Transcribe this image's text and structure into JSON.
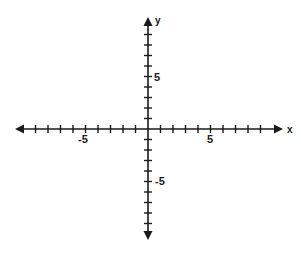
{
  "chart_data": {
    "type": "coordinate-plane",
    "title": "",
    "xlabel": "x",
    "ylabel": "y",
    "xlim": [
      -10,
      10
    ],
    "ylim": [
      -10,
      10
    ],
    "x_ticks": [
      -9,
      -8,
      -7,
      -6,
      -5,
      -4,
      -3,
      -2,
      -1,
      1,
      2,
      3,
      4,
      5,
      6,
      7,
      8,
      9
    ],
    "y_ticks": [
      -9,
      -8,
      -7,
      -6,
      -5,
      -4,
      -3,
      -2,
      -1,
      1,
      2,
      3,
      4,
      5,
      6,
      7,
      8,
      9
    ],
    "x_tick_labels": [
      {
        "value": -5,
        "text": "-5"
      },
      {
        "value": 5,
        "text": "5"
      }
    ],
    "y_tick_labels": [
      {
        "value": 5,
        "text": "5"
      },
      {
        "value": -5,
        "text": "-5"
      }
    ],
    "grid": false,
    "arrows": true,
    "series": []
  },
  "layout": {
    "origin": [
      148,
      129
    ],
    "x_unit_px": 12.5,
    "y_unit_px": 10.5,
    "x_axis_ends": [
      15,
      283
    ],
    "y_axis_ends": [
      17,
      240
    ],
    "axis_color": "#1a1a1a"
  },
  "labels": {
    "x_axis": "x",
    "y_axis": "y",
    "x_neg5": "-5",
    "x_pos5": "5",
    "y_pos5": "5",
    "y_neg5": "-5"
  }
}
